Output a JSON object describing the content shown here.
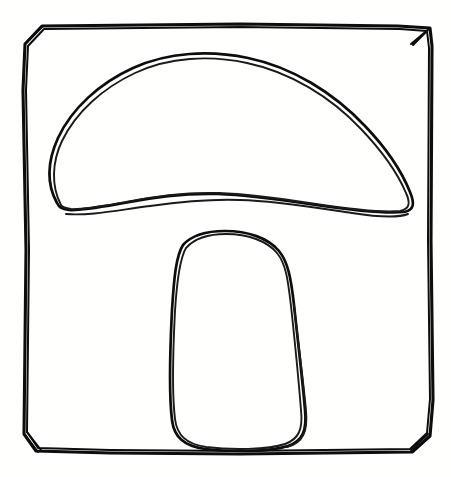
{
  "image": {
    "title": "Hand-drawn mushroom sketch",
    "description": "A simple black ink line drawing of a mushroom with a wide rounded cap and a tapered rounded stem, enclosed in a hand-drawn square border with clipped corners.",
    "medium": "ink line drawing",
    "width_px": 451,
    "height_px": 477,
    "colors": {
      "background": "#fffffe",
      "ink": "#0d0d0d",
      "ink_secondary": "#1a1a1a"
    }
  },
  "subject": {
    "name": "mushroom",
    "parts": [
      {
        "id": "cap",
        "label": "mushroom cap"
      },
      {
        "id": "stem",
        "label": "mushroom stem"
      }
    ]
  },
  "frame": {
    "name": "hand-drawn square border",
    "corner_style": "chamfered",
    "stroke_passes": 2,
    "bounds": {
      "left": 24,
      "top": 25,
      "right": 432,
      "bottom": 453
    }
  },
  "paths": {
    "frame_outer": "M 42,26 L 240,24 L 398,26 L 430,28 L 432,46 L 431,240 L 433,400 L 430,436 L 412,452 L 240,454 L 110,453 L 36,451 L 24,434 L 26,250 L 23,90 L 25,44 Z",
    "frame_inner_echo": "M 44,29 L 240,27 L 400,29 L 427,31 L 429,48 L 428,240 L 430,399 L 427,433 L 410,449 L 240,451 L 110,450 L 38,448 L 27,432 L 29,250 L 26,90 L 28,46 Z",
    "frame_corner_tl": "M 25,44 L 43,26",
    "frame_corner_tr": "M 430,28 L 411,44 M 428,30 L 413,45",
    "frame_corner_bl": "M 24,434 L 38,452 M 27,432 L 41,450",
    "frame_corner_br": "M 430,436 L 413,452 M 428,434 L 411,450",
    "cap_outline": "M 57,203 C 46,183 48,160 58,138 C 72,108 100,83 133,68 C 168,52 210,50 248,58 C 292,67 334,93 365,126 C 386,148 402,172 410,192 C 415,204 414,210 404,212 C 384,214 350,210 316,205 C 282,200 246,195 218,194 C 186,193 154,197 124,203 C 101,207 80,211 69,210 C 61,209 59,207 57,203 Z",
    "cap_echo": "M 61,205 C 51,186 52,162 62,141 C 76,112 103,88 135,73 C 169,57 210,55 247,63 C 290,72 331,97 361,129 C 382,151 398,174 406,193 C 411,204 409,209 400,211 C 381,213 349,209 316,204 C 283,199 247,194 219,193 C 187,192 155,196 126,202 C 103,206 82,210 71,209 C 64,208 62,207 61,205",
    "cap_rim_lower": "M 66,214 C 90,216 118,210 150,206 C 186,201 216,199 240,200 C 278,201 318,208 352,213 C 378,217 398,218 408,214",
    "stem_outline": "M 183,245 C 191,236 206,231 225,231 C 248,231 268,238 279,251 C 288,262 291,278 294,305 C 298,342 303,385 305,410 C 307,430 303,441 288,446 C 270,452 230,452 205,449 C 184,446 174,437 172,420 C 169,396 170,350 172,310 C 174,278 176,256 183,245 Z",
    "stem_echo": "M 186,248 C 194,239 208,234 226,234 C 248,234 267,241 277,253 C 286,264 288,280 291,306 C 295,343 299,385 301,410 C 303,429 299,439 285,444 C 268,450 230,450 206,447 C 186,444 177,435 175,419 C 172,395 173,350 175,311 C 177,279 180,258 186,248",
    "stem_right_tail": "M 294,305 C 298,342 304,386 306,411 C 308,431 303,443 287,447"
  },
  "annotations": {
    "stroke_quality": "wobbly, double-traced freehand lines",
    "fill": "none — outline only"
  }
}
